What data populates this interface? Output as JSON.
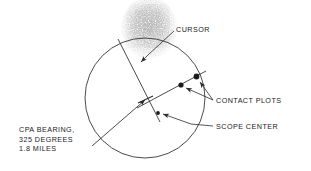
{
  "figure": {
    "type": "radar-ppi-scope-diagram",
    "stroke_color": "#2b2b2b",
    "noise_color": "#8a8a8a",
    "background": "#ffffff"
  },
  "labels": {
    "cursor": "CURSOR",
    "contact_plots": "CONTACT PLOTS",
    "scope_center": "SCOPE CENTER",
    "cpa_line1": "CPA BEARING,",
    "cpa_line2": "325 DEGREES",
    "cpa_line3": "1.8 MILES"
  },
  "geometry": {
    "scope_circle": {
      "cx": 145,
      "cy": 98,
      "r": 60
    },
    "scope_center_dot": {
      "x": 158,
      "y": 113
    },
    "cpa_tick": {
      "x": 146,
      "y": 99
    },
    "contact_plots": [
      {
        "x": 181,
        "y": 85
      },
      {
        "x": 196,
        "y": 77
      }
    ],
    "cursor_line": {
      "x1": 118,
      "y1": 39,
      "x2": 160,
      "y2": 122
    },
    "contact_track_line": {
      "x1": 139,
      "y1": 107,
      "x2": 204,
      "y2": 72
    },
    "cpa_bearing_line": {
      "x1": 94,
      "y1": 143,
      "x2": 146,
      "y2": 99
    },
    "noise_blob": {
      "x": 120,
      "y": 0,
      "width": 58,
      "height": 62
    }
  },
  "readings": {
    "cpa_bearing_degrees": 325,
    "cpa_range_miles": 1.8
  }
}
